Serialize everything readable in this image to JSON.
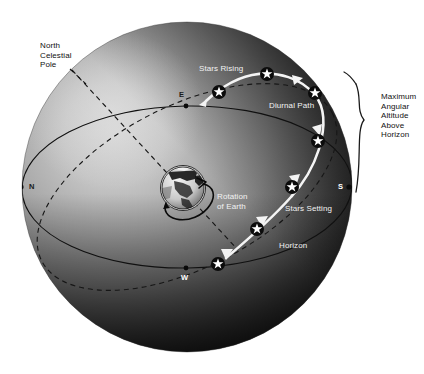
{
  "diagram": {
    "background_color": "#ffffff",
    "sphere": {
      "center_x": 187,
      "center_y": 187,
      "radius": 165,
      "light_color": "#b9b9b9",
      "mid_color": "#7a7a7a",
      "dark_color": "#0d0d0d"
    }
  },
  "labels": {
    "north_celestial_pole": "North\nCelestial\nPole",
    "stars_rising": "Stars Rising",
    "diurnal_path": "Diurnal Path",
    "stars_setting": "Stars Setting",
    "rotation_of_earth": "Rotation\nof Earth",
    "horizon": "Horizon",
    "maximum_angular_altitude": "Maximum\nAngular\nAltitude\nAbove\nHorizon"
  },
  "cardinal_points": [
    {
      "name": "north",
      "label": "N",
      "x": 21,
      "y": 187,
      "text_x": 29,
      "text_y": 182,
      "style": "dark"
    },
    {
      "name": "east",
      "label": "E",
      "x": 186,
      "y": 106,
      "text_x": 179,
      "text_y": 90,
      "style": "dark"
    },
    {
      "name": "south",
      "label": "S",
      "x": 349,
      "y": 187,
      "text_x": 338,
      "text_y": 182,
      "style": "light"
    },
    {
      "name": "west",
      "label": "W",
      "x": 186,
      "y": 268,
      "text_x": 181,
      "text_y": 273,
      "style": "light"
    }
  ],
  "stars": [
    {
      "name": "star-rising-horizon",
      "x": 219,
      "y": 92,
      "ring": "dark"
    },
    {
      "name": "star-rising-low",
      "x": 267,
      "y": 74,
      "ring": "dark"
    },
    {
      "name": "star-upper-right",
      "x": 315,
      "y": 93,
      "ring": "dark"
    },
    {
      "name": "star-max-altitude",
      "x": 318,
      "y": 141,
      "ring": "dark"
    },
    {
      "name": "star-descending",
      "x": 292,
      "y": 187,
      "ring": "dark"
    },
    {
      "name": "star-setting",
      "x": 257,
      "y": 229,
      "ring": "dark"
    },
    {
      "name": "star-setting-horizon",
      "x": 218,
      "y": 264,
      "ring": "dark"
    }
  ],
  "earth": {
    "name": "earth-globe",
    "center_x": 183,
    "center_y": 188,
    "radius": 22
  },
  "label_positions": {
    "north_celestial_pole": {
      "x": 40,
      "y": 41
    },
    "stars_rising": {
      "x": 199,
      "y": 64
    },
    "diurnal_path": {
      "x": 269,
      "y": 101
    },
    "maximum_angular_altitude": {
      "x": 381,
      "y": 92
    },
    "rotation_of_earth": {
      "x": 217,
      "y": 192
    },
    "stars_setting": {
      "x": 285,
      "y": 204
    },
    "horizon": {
      "x": 279,
      "y": 241
    }
  }
}
